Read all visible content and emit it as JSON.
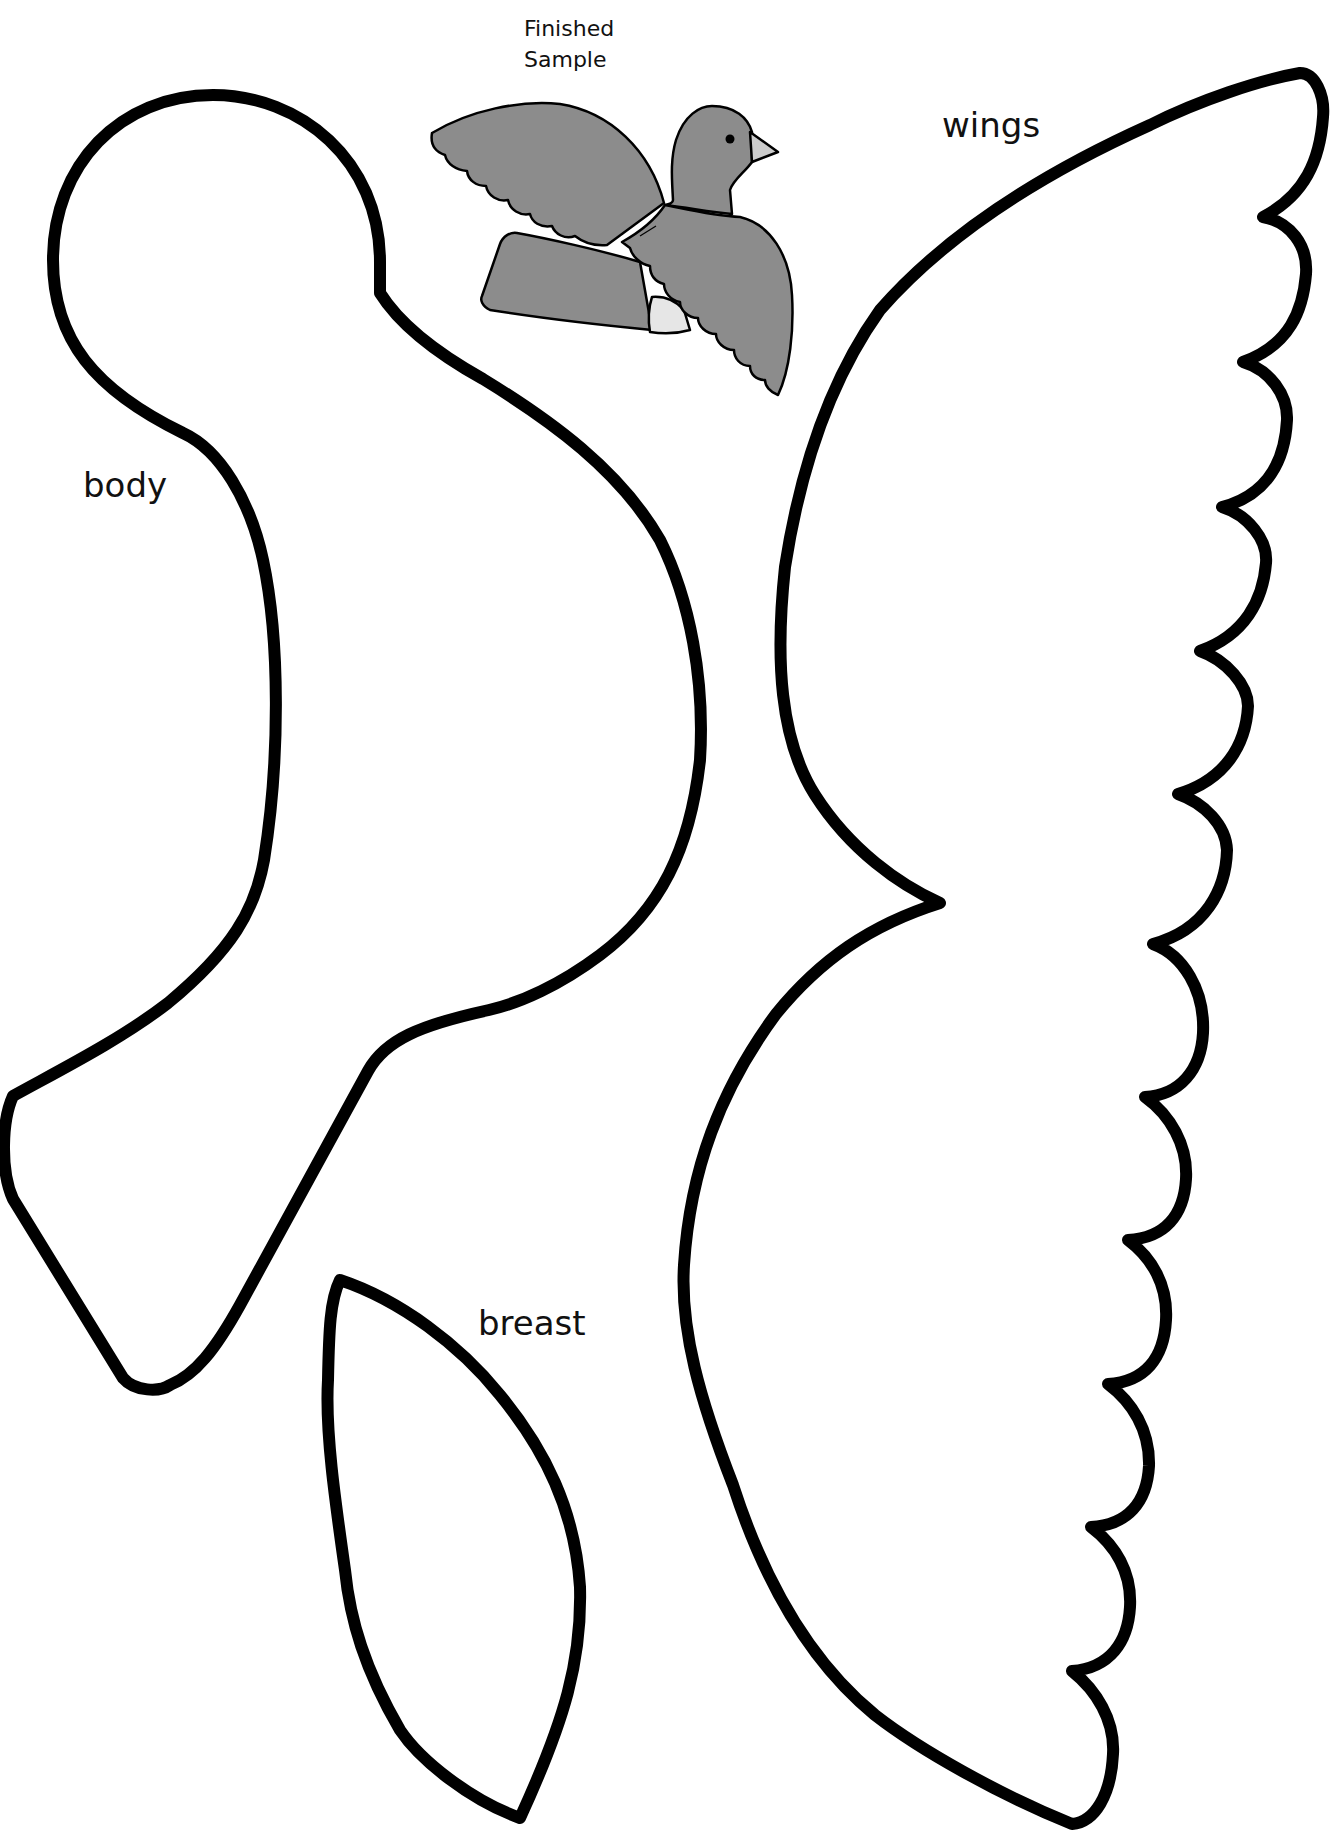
{
  "sample": {
    "title_line1": "Finished",
    "title_line2": "Sample",
    "colors": {
      "plumage": "#8c8c8c",
      "belly": "#e6e6e6",
      "beak": "#cccccc",
      "eye": "#000000"
    }
  },
  "pieces": {
    "body": {
      "label": "body"
    },
    "wings": {
      "label": "wings"
    },
    "breast": {
      "label": "breast"
    }
  },
  "style": {
    "outline_color": "#000000",
    "background": "#ffffff"
  }
}
